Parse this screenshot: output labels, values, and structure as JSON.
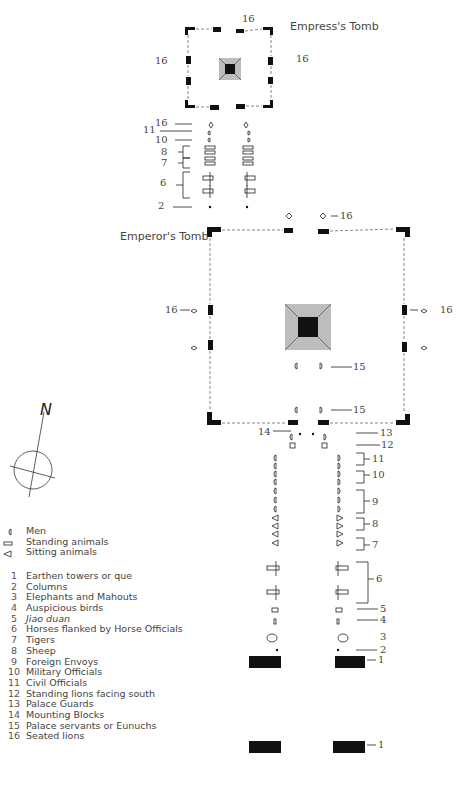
{
  "diagram": {
    "empress_tomb": {
      "title": "Empress's Tomb",
      "label_left": "16",
      "label_top": "16",
      "label_right": "16"
    },
    "emperor_tomb": {
      "title": "Emperor's Tomb",
      "label_left": "16",
      "label_top": "16",
      "label_right": "16",
      "label_15a": "15",
      "label_15b": "15",
      "label_14": "14"
    },
    "empress_path_labels": [
      "16",
      "11",
      "10",
      "8",
      "7",
      "6",
      "2"
    ],
    "emperor_path_labels": [
      "13",
      "12",
      "11",
      "10",
      "9",
      "8",
      "7",
      "6",
      "5",
      "4",
      "3",
      "2",
      "1",
      "1"
    ],
    "compass": {
      "north_label": "N"
    }
  },
  "legend": {
    "symbols": [
      {
        "icon": "men-icon",
        "glyph": "◖",
        "label": "Men"
      },
      {
        "icon": "standing-animal-icon",
        "glyph": "▭",
        "label": "Standing animals"
      },
      {
        "icon": "sitting-animal-icon",
        "glyph": "◁",
        "label": "Sitting animals"
      }
    ],
    "items": [
      {
        "num": "1",
        "label": "Earthen towers or que"
      },
      {
        "num": "2",
        "label": "Columns"
      },
      {
        "num": "3",
        "label": "Elephants and Mahouts"
      },
      {
        "num": "4",
        "label": "Auspicious birds"
      },
      {
        "num": "5",
        "label": "Jiao duan",
        "italic": true
      },
      {
        "num": "6",
        "label": "Horses flanked by Horse Officials"
      },
      {
        "num": "7",
        "label": "Tigers"
      },
      {
        "num": "8",
        "label": "Sheep"
      },
      {
        "num": "9",
        "label": "Foreign Envoys"
      },
      {
        "num": "10",
        "label": "Military Officials"
      },
      {
        "num": "11",
        "label": "Civil Officials"
      },
      {
        "num": "12",
        "label": "Standing lions facing south"
      },
      {
        "num": "13",
        "label": "Palace Guards"
      },
      {
        "num": "14",
        "label": "Mounting Blocks"
      },
      {
        "num": "15",
        "label": "Palace servants or Eunuchs"
      },
      {
        "num": "16",
        "label": "Seated lions"
      }
    ]
  },
  "colors": {
    "structure": "#111111",
    "pyramid": "#bdbdbd",
    "line": "#555555",
    "text": "#444444"
  }
}
